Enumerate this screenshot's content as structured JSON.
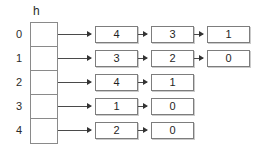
{
  "diagram": {
    "array_caption": "h",
    "buckets": [
      {
        "index_label": "0",
        "chain": [
          "4",
          "3",
          "1"
        ]
      },
      {
        "index_label": "1",
        "chain": [
          "3",
          "2",
          "0"
        ]
      },
      {
        "index_label": "2",
        "chain": [
          "4",
          "1"
        ]
      },
      {
        "index_label": "3",
        "chain": [
          "1",
          "0"
        ]
      },
      {
        "index_label": "4",
        "chain": [
          "2",
          "0"
        ]
      }
    ]
  },
  "colors": {
    "background": "#ffffff",
    "box_border": "#7d7d7d",
    "array_border": "#8a8a8a",
    "arrow": "#4a4a4a",
    "text": "#1f1f1f"
  }
}
